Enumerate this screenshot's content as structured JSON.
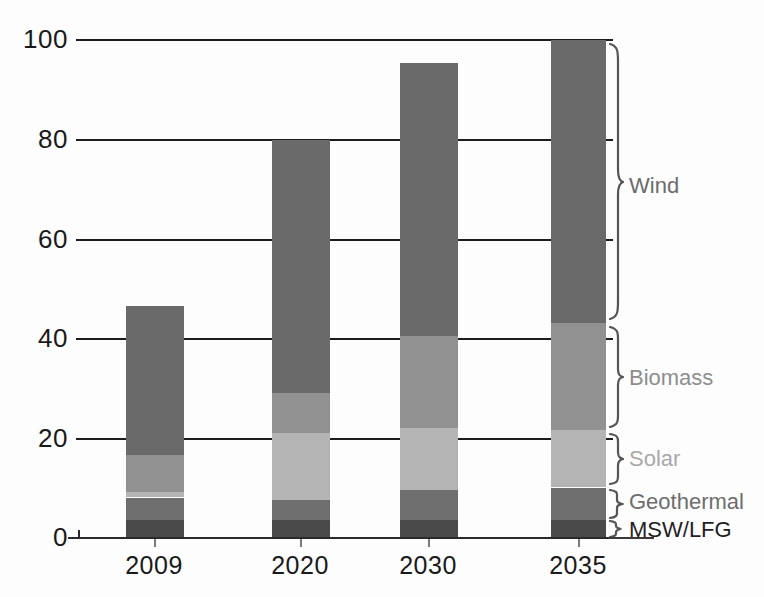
{
  "chart_data": {
    "type": "bar",
    "subtype": "stacked-bar",
    "title": "",
    "subtitle": "",
    "xlabel": "",
    "ylabel": "",
    "categories": [
      "2009",
      "2020",
      "2030",
      "2035"
    ],
    "ylim": [
      0,
      100
    ],
    "yticks": [
      0,
      20,
      40,
      60,
      80,
      100
    ],
    "ytick_labels": [
      "0",
      "20",
      "40",
      "60",
      "80",
      "100"
    ],
    "grid": true,
    "grid_axis": "y",
    "legend_position": "right-braces",
    "series": [
      {
        "name": "MSW/LFG",
        "color": "#4a4a4a",
        "values": [
          3.5,
          3.5,
          3.5,
          3.5
        ]
      },
      {
        "name": "Geothermal",
        "color": "#6e6e6e",
        "values": [
          4.5,
          4.0,
          6.0,
          6.5
        ]
      },
      {
        "name": "Solar",
        "color": "#b4b4b4",
        "values": [
          1.0,
          13.5,
          12.5,
          11.5
        ]
      },
      {
        "name": "Biomass",
        "color": "#919191",
        "values": [
          7.5,
          8.0,
          18.5,
          21.5
        ]
      },
      {
        "name": "Wind",
        "color": "#6a6a6a",
        "values": [
          30.0,
          51.0,
          55.0,
          57.0
        ]
      }
    ],
    "totals": [
      46.5,
      80.0,
      95.5,
      100.0
    ],
    "annotations": [
      {
        "label": "Wind",
        "kind": "brace-label"
      },
      {
        "label": "Biomass",
        "kind": "brace-label"
      },
      {
        "label": "Solar",
        "kind": "brace-label"
      },
      {
        "label": "Geothermal",
        "kind": "brace-label"
      },
      {
        "label": "MSW/LFG",
        "kind": "brace-label"
      }
    ]
  },
  "axes": {
    "y": {
      "ticks": [
        {
          "value": 100,
          "label": "100"
        },
        {
          "value": 80,
          "label": "80"
        },
        {
          "value": 60,
          "label": "60"
        },
        {
          "value": 40,
          "label": "40"
        },
        {
          "value": 20,
          "label": "20"
        },
        {
          "value": 0,
          "label": "0"
        }
      ]
    },
    "x": {
      "ticks": [
        {
          "label": "2009"
        },
        {
          "label": "2020"
        },
        {
          "label": "2030"
        },
        {
          "label": "2035"
        }
      ]
    }
  },
  "legend": {
    "wind": "Wind",
    "biomass": "Biomass",
    "solar": "Solar",
    "geothermal": "Geothermal",
    "mswlfg": "MSW/LFG"
  },
  "colors": {
    "wind": "#6a6a6a",
    "biomass": "#919191",
    "solar": "#b4b4b4",
    "geothermal": "#6e6e6e",
    "mswlfg": "#4a4a4a",
    "axis": "#1c1c1c",
    "background": "#fdfdfd"
  }
}
